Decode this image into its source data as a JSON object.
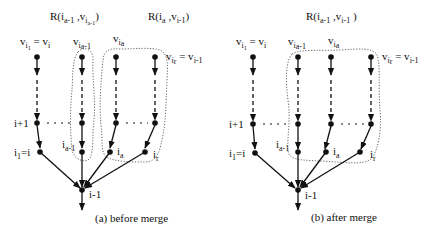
{
  "panels": [
    {
      "id": "before",
      "caption": "(a) before merge",
      "regions": [
        {
          "base": "R(i",
          "sub1": "a-1",
          "mid": " ,v",
          "sub2": "i",
          "sub3": "a-1",
          "end": ")"
        },
        {
          "base": "R(i",
          "sub1": "a",
          "mid": " ,v",
          "sub2": "i-1",
          "sub3": "",
          "end": ")"
        }
      ],
      "top_labels": {
        "c1": {
          "v": "v",
          "s": "i",
          "ss": "1",
          "eq": " = v",
          "es": "i"
        },
        "c2": {
          "v": "v",
          "s": "i",
          "ss": "a-1"
        },
        "c3": {
          "v": "v",
          "s": "i",
          "ss": "a"
        },
        "c4": {
          "v": "v",
          "s": "i",
          "ss": "r",
          "eq": " = v",
          "es": "i-1"
        }
      },
      "row_labels": {
        "i_plus_1": "i+1",
        "i1": "i",
        "i1_sub": "1",
        "i1_eq": "=i",
        "ia_minus_1": "i",
        "ia_minus_1_sub": "a-1",
        "ia": "i",
        "ia_sub": "a",
        "ir": "i",
        "ir_sub": "r",
        "root": "i-1"
      }
    },
    {
      "id": "after",
      "caption": "(b) after merge",
      "regions": [
        {
          "base": "R(i",
          "sub1": "a-1",
          "mid": " ,v",
          "sub2": "i-1",
          "sub3": "",
          "end": " )"
        }
      ],
      "top_labels": {
        "c1": {
          "v": "v",
          "s": "i",
          "ss": "1",
          "eq": " = v",
          "es": "i"
        },
        "c2": {
          "v": "v",
          "s": "i",
          "ss": "a-1"
        },
        "c3": {
          "v": "v",
          "s": "i",
          "ss": "a"
        },
        "c4": {
          "v": "v",
          "s": "i",
          "ss": "r",
          "eq": " = v",
          "es": "i-1"
        }
      },
      "row_labels": {
        "i_plus_1": "i+1",
        "i1": "i",
        "i1_sub": "1",
        "i1_eq": "=i",
        "ia_minus_1": "i",
        "ia_minus_1_sub": "a-1",
        "ia": "i",
        "ia_sub": "a",
        "ir": "i",
        "ir_sub": "r",
        "root": "i-1"
      }
    }
  ]
}
